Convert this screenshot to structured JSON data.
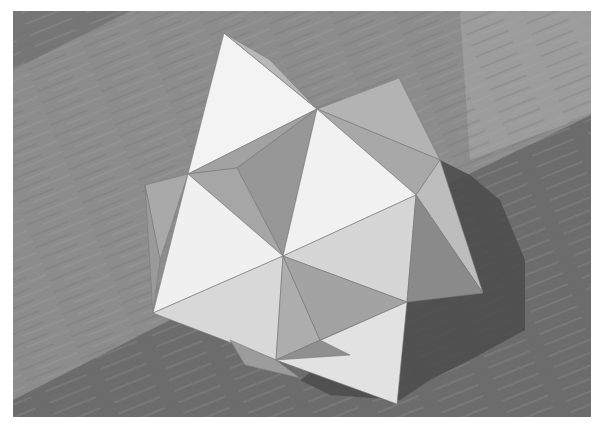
{
  "image": {
    "subject": "Paper model of a compound polyhedron (star-shaped, triangular facets) resting on a wooden table",
    "palette": {
      "border": "#ffffff",
      "wood_light": "#9a9a9a",
      "wood_mid": "#858585",
      "wood_dark": "#6a6a6a",
      "shadow": "#4e4e4e",
      "face_white": "#f4f4f4",
      "face_light": "#d9d9d9",
      "face_mid": "#b4b4b4",
      "face_dark": "#9a9a9a"
    }
  }
}
